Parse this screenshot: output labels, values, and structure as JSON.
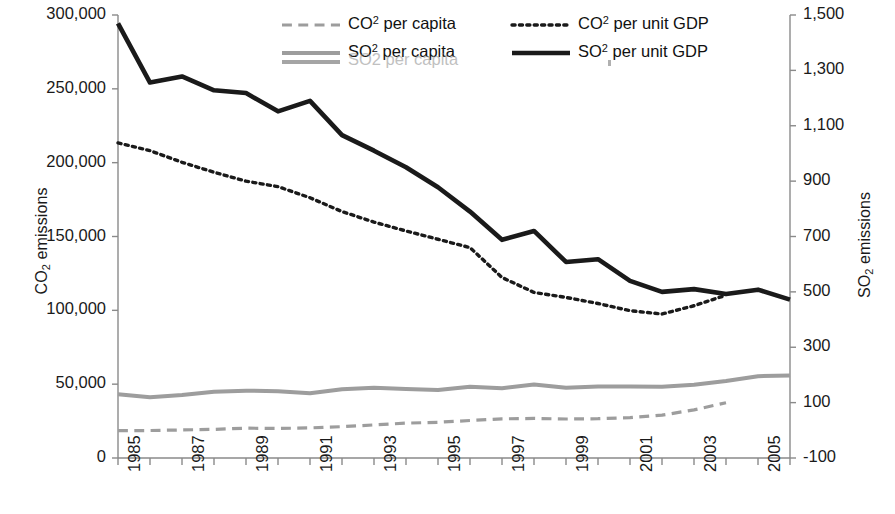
{
  "chart_data": {
    "type": "line",
    "title": "",
    "xlabel": "",
    "x": [
      1985,
      1986,
      1987,
      1988,
      1989,
      1990,
      1991,
      1992,
      1993,
      1994,
      1995,
      1996,
      1997,
      1998,
      1999,
      2000,
      2001,
      2002,
      2003,
      2004,
      2005,
      2006
    ],
    "x_tick_labels": [
      "1985",
      "1987",
      "1989",
      "1991",
      "1993",
      "1995",
      "1997",
      "1999",
      "2001",
      "2003",
      "2005"
    ],
    "x_tick_label_years": [
      1985,
      1987,
      1989,
      1991,
      1993,
      1995,
      1997,
      1999,
      2001,
      2003,
      2005
    ],
    "xlim": [
      1985,
      2006
    ],
    "grid": false,
    "legend_position": "top-center",
    "axes": {
      "left": {
        "label": "CO2 emissions",
        "label_base": "CO",
        "label_sub": "2",
        "label_tail": " emissions",
        "ticks": [
          0,
          50000,
          100000,
          150000,
          200000,
          250000,
          300000
        ],
        "tick_labels": [
          "0",
          "50,000",
          "100,000",
          "150,000",
          "200,000",
          "250,000",
          "300,000"
        ],
        "ylim": [
          0,
          300000
        ]
      },
      "right": {
        "label": "SO2 emissions",
        "label_base": "SO",
        "label_sub": "2",
        "label_tail": " emissions",
        "ticks": [
          -100,
          100,
          300,
          500,
          700,
          900,
          1100,
          1300,
          1500
        ],
        "tick_labels": [
          "-100",
          "100",
          "300",
          "500",
          "700",
          "900",
          "1,100",
          "1,300",
          "1,500"
        ],
        "ylim": [
          -100,
          1500
        ]
      }
    },
    "series": [
      {
        "name": "CO2 per capita",
        "label_base": "CO",
        "label_sup": "2",
        "label_tail": " per capita",
        "axis": "left",
        "color": "#9d9d9d",
        "style": "dashed",
        "width": 3.2,
        "x": [
          1985,
          1986,
          1987,
          1988,
          1989,
          1990,
          1991,
          1992,
          1993,
          1994,
          1995,
          1996,
          1997,
          1998,
          1999,
          2000,
          2001,
          2002,
          2003,
          2004
        ],
        "values": [
          18500,
          18600,
          19000,
          19400,
          20200,
          20000,
          20400,
          21200,
          22400,
          23600,
          24200,
          25400,
          26500,
          26800,
          26400,
          26600,
          27400,
          29000,
          32600,
          37400
        ]
      },
      {
        "name": "SO2 per capita",
        "label_base": "SO",
        "label_sup": "2",
        "label_tail": " per capita",
        "axis": "left",
        "color": "#9d9d9d",
        "style": "solid",
        "width": 4.0,
        "x": [
          1985,
          1986,
          1987,
          1988,
          1989,
          1990,
          1991,
          1992,
          1993,
          1994,
          1995,
          1996,
          1997,
          1998,
          1999,
          2000,
          2001,
          2002,
          2003,
          2004,
          2005,
          2006
        ],
        "values": [
          43200,
          41200,
          42600,
          44800,
          45600,
          45200,
          43800,
          46600,
          47600,
          46800,
          46000,
          48200,
          47200,
          49800,
          47600,
          48400,
          48400,
          48200,
          49600,
          52200,
          55400,
          55800
        ]
      },
      {
        "name": "CO2 per unit GDP",
        "label_base": "CO",
        "label_sup": "2",
        "label_tail": " per unit GDP",
        "axis": "right",
        "color": "#1a1a1a",
        "style": "dotted",
        "width": 3.4,
        "x": [
          1985,
          1986,
          1987,
          1988,
          1989,
          1990,
          1991,
          1992,
          1993,
          1994,
          1995,
          1996,
          1997,
          1998,
          1999,
          2000,
          2001,
          2002,
          2003,
          2004
        ],
        "values": [
          1038,
          1010,
          968,
          932,
          900,
          880,
          840,
          790,
          752,
          720,
          690,
          660,
          552,
          498,
          480,
          458,
          432,
          420,
          450,
          488
        ]
      },
      {
        "name": "SO2 per unit GDP",
        "label_base": "SO",
        "label_sup": "2",
        "label_tail": " per unit GDP",
        "axis": "right",
        "color": "#1a1a1a",
        "style": "solid",
        "width": 4.6,
        "x": [
          1985,
          1986,
          1987,
          1988,
          1989,
          1990,
          1991,
          1992,
          1993,
          1994,
          1995,
          1996,
          1997,
          1998,
          1999,
          2000,
          2001,
          2002,
          2003,
          2004,
          2005,
          2006
        ],
        "values": [
          1470,
          1256,
          1278,
          1228,
          1218,
          1152,
          1190,
          1066,
          1010,
          950,
          878,
          790,
          688,
          720,
          608,
          618,
          540,
          500,
          510,
          492,
          508,
          472
        ]
      }
    ]
  },
  "legend": {
    "entries": [
      {
        "label": "CO2 per capita",
        "base": "CO",
        "sup": "2",
        "tail": " per capita",
        "style": "dashed",
        "color": "#9d9d9d"
      },
      {
        "label": "SO2 per capita",
        "base": "SO",
        "sup": "2",
        "tail": " per capita",
        "style": "solid",
        "color": "#9d9d9d"
      },
      {
        "label": "CO2 per unit GDP",
        "base": "CO",
        "sup": "2",
        "tail": " per unit GDP",
        "style": "dotted",
        "color": "#1a1a1a"
      },
      {
        "label": "SO2 per unit GDP",
        "base": "SO",
        "sup": "2",
        "tail": " per unit GDP",
        "style": "solid",
        "color": "#1a1a1a"
      }
    ],
    "ghost_artifact": {
      "base": "SO2",
      "tail": " per capita",
      "label": "SO2 per capita"
    }
  }
}
